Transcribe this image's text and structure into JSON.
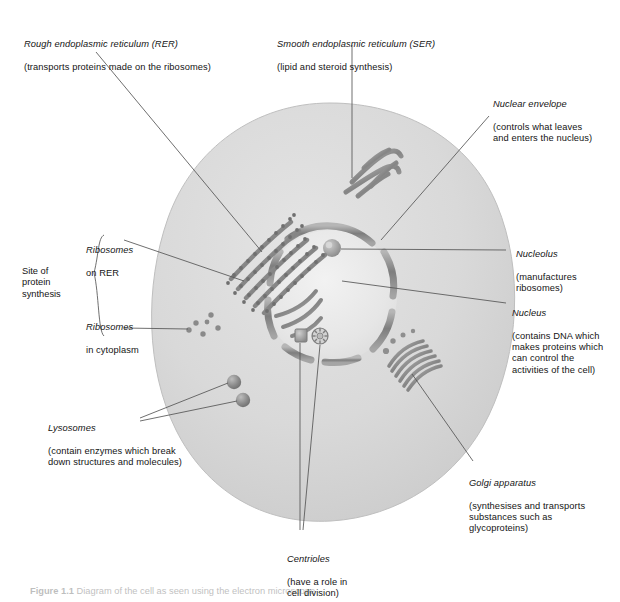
{
  "figure": {
    "caption_number": "Figure 1.1",
    "caption_text": "Diagram of the cell as seen using the electron microscope",
    "background_color": "#ffffff",
    "cell_fill_color": "#d8d8d8",
    "organelle_color": "#8d8d8d",
    "leader_line_color": "#555555",
    "text_color": "#141414"
  },
  "labels": {
    "rer": {
      "title": "Rough endoplasmic reticulum (RER)",
      "detail": "(transports proteins made on the ribosomes)"
    },
    "ser": {
      "title": "Smooth endoplasmic reticulum (SER)",
      "detail": "(lipid and steroid synthesis)"
    },
    "nuclear_envelope": {
      "title": "Nuclear envelope",
      "detail": "(controls what leaves\nand enters the nucleus)"
    },
    "nucleolus": {
      "title": "Nucleolus",
      "detail": "(manufactures\nribosomes)"
    },
    "nucleus": {
      "title": "Nucleus",
      "detail": "(contains DNA which\nmakes proteins which\ncan control the\nactivities of the cell)"
    },
    "golgi": {
      "title": "Golgi apparatus",
      "detail": "(synthesises and transports\nsubstances such as\nglycoproteins)"
    },
    "lysosomes": {
      "title": "Lysosomes",
      "detail": "(contain enzymes which break\ndown structures and molecules)"
    },
    "centrioles": {
      "title": "Centrioles",
      "detail": "(have a role in\ncell division)"
    },
    "ribosomes_on_rer": {
      "title": "Ribosomes",
      "detail": "on RER"
    },
    "ribosomes_in_cytoplasm": {
      "title": "Ribosomes",
      "detail": "in cytoplasm"
    },
    "bracket_group": {
      "line1": "Site of",
      "line2": "protein",
      "line3": "synthesis"
    }
  },
  "structures": [
    {
      "name": "cell-membrane",
      "kind": "outline"
    },
    {
      "name": "cytoplasm",
      "kind": "fill"
    },
    {
      "name": "nucleus",
      "kind": "organelle"
    },
    {
      "name": "nuclear-envelope",
      "kind": "organelle"
    },
    {
      "name": "nucleolus",
      "kind": "organelle"
    },
    {
      "name": "rough-er",
      "kind": "organelle"
    },
    {
      "name": "smooth-er",
      "kind": "organelle"
    },
    {
      "name": "golgi-apparatus",
      "kind": "organelle"
    },
    {
      "name": "lysosome",
      "kind": "organelle",
      "count": 2
    },
    {
      "name": "centriole",
      "kind": "organelle",
      "count": 2
    },
    {
      "name": "free-ribosome",
      "kind": "organelle",
      "count": 6
    }
  ]
}
